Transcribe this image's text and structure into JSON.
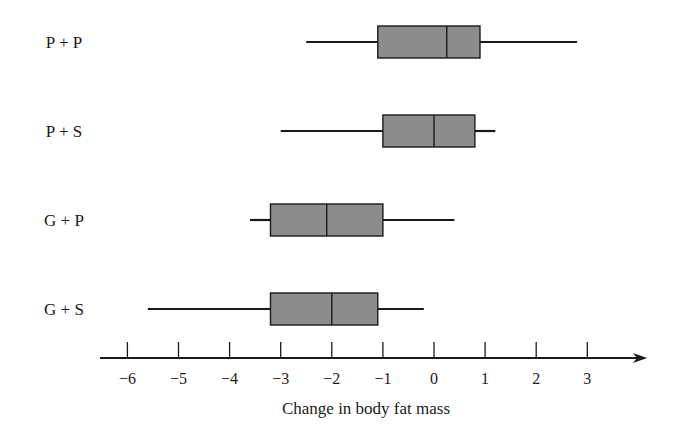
{
  "chart_data": {
    "type": "boxplot",
    "orientation": "horizontal",
    "title": "",
    "xlabel": "Change in body fat mass",
    "ylabel": "",
    "xlim": [
      -6.5,
      4.1
    ],
    "x_ticks": [
      -6,
      -5,
      -4,
      -3,
      -2,
      -1,
      0,
      1,
      2,
      3
    ],
    "x_tick_labels": [
      "−6",
      "−5",
      "−4",
      "−3",
      "−2",
      "−1",
      "0",
      "1",
      "2",
      "3"
    ],
    "grid": false,
    "legend": null,
    "categories": [
      "P + P",
      "P + S",
      "G + P",
      "G + S"
    ],
    "series": [
      {
        "name": "P + P",
        "min": -2.5,
        "q1": -1.1,
        "median": 0.25,
        "q3": 0.9,
        "max": 2.8
      },
      {
        "name": "P + S",
        "min": -3.0,
        "q1": -1.0,
        "median": 0.0,
        "q3": 0.8,
        "max": 1.2
      },
      {
        "name": "G + P",
        "min": -3.6,
        "q1": -3.2,
        "median": -2.1,
        "q3": -1.0,
        "max": 0.4
      },
      {
        "name": "G + S",
        "min": -5.6,
        "q1": -3.2,
        "median": -2.0,
        "q3": -1.1,
        "max": -0.2
      }
    ],
    "colors": {
      "box_fill": "#8c8c8c",
      "stroke": "#1a1a1a"
    }
  }
}
